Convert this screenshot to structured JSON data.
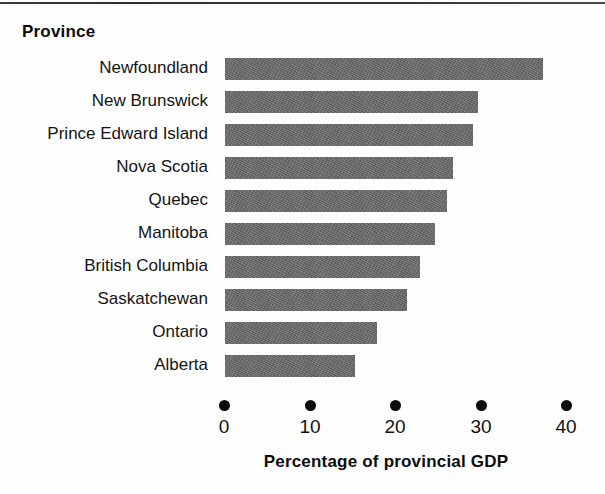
{
  "figure": {
    "category_axis_title": "Province",
    "value_axis_title": "Percentage of provincial GDP"
  },
  "chart_data": {
    "type": "bar",
    "orientation": "horizontal",
    "title": "",
    "xlabel": "Percentage of provincial GDP",
    "ylabel": "Province",
    "categories": [
      "Newfoundland",
      "New Brunswick",
      "Prince Edward Island",
      "Nova Scotia",
      "Quebec",
      "Manitoba",
      "British Columbia",
      "Saskatchewan",
      "Ontario",
      "Alberta"
    ],
    "values": [
      37.3,
      29.7,
      29.1,
      26.8,
      26.0,
      24.6,
      22.9,
      21.4,
      17.8,
      15.3
    ],
    "xlim": [
      0,
      40
    ],
    "xticks": [
      0,
      10,
      20,
      30,
      40
    ],
    "xtick_labels": [
      "0",
      "10",
      "20",
      "30",
      "40"
    ],
    "grid": false,
    "legend": null,
    "bar_color": "#6d6d6d",
    "text_color": "#111111",
    "tick_marker": "filled-circle"
  }
}
